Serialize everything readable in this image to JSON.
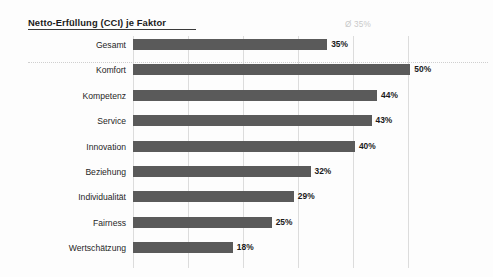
{
  "chart": {
    "title": "Netto-Erfüllung (CCI) je Faktor",
    "average_annotation": "Ø 35%"
  },
  "chart_data": {
    "type": "bar",
    "orientation": "horizontal",
    "title": "Netto-Erfüllung (CCI) je Faktor",
    "subtitle": "",
    "xlabel": "",
    "ylabel": "",
    "categories": [
      "Gesamt",
      "Komfort",
      "Kompetenz",
      "Service",
      "Innovation",
      "Beziehung",
      "Individualität",
      "Fairness",
      "Wertschätzung"
    ],
    "values": [
      35,
      50,
      44,
      43,
      40,
      32,
      29,
      25,
      18
    ],
    "value_labels": [
      "35%",
      "50%",
      "44%",
      "43%",
      "40%",
      "32%",
      "29%",
      "25%",
      "18%"
    ],
    "unit": "%",
    "xlim": [
      0,
      53
    ],
    "xticks": [
      0,
      10,
      20,
      30,
      40,
      50
    ],
    "xtick_labels": [
      "",
      "",
      "",
      "",
      "",
      ""
    ],
    "grid": "vertical-only",
    "legend": "none",
    "bar_color": "#5a5a5a",
    "gridline_color": "#dcdcdc",
    "annotations": [
      {
        "name": "average",
        "text": "Ø 35%",
        "value": 35,
        "color": "#c9c9c9"
      }
    ]
  }
}
